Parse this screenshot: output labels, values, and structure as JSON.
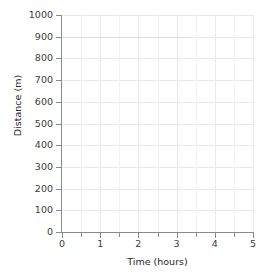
{
  "chart_data": {
    "type": "line",
    "title": "",
    "subtitle": "",
    "xlabel": "Time (hours)",
    "ylabel": "Distance (m)",
    "xlim": [
      0,
      5
    ],
    "ylim": [
      0,
      1000
    ],
    "x_tick_labels": [
      "0",
      "1",
      "2",
      "3",
      "4",
      "5"
    ],
    "x_tick_values": [
      0,
      1,
      2,
      3,
      4,
      5
    ],
    "x_minor_tick_values": [
      0.5,
      1.5,
      2.5,
      3.5,
      4.5
    ],
    "y_tick_labels": [
      "0",
      "100",
      "200",
      "300",
      "400",
      "500",
      "600",
      "700",
      "800",
      "900",
      "1000"
    ],
    "y_tick_values": [
      0,
      100,
      200,
      300,
      400,
      500,
      600,
      700,
      800,
      900,
      1000
    ],
    "grid": true,
    "grid_minor": true,
    "legend": false,
    "legend_position": "none",
    "series": [],
    "values": [],
    "categories": [],
    "annotations": [
      {
        "name": "residual-trace-at-900",
        "y_value": 900,
        "x_start": 0,
        "x_end": 3.35,
        "color": "#dcdce0"
      }
    ]
  },
  "axes": {
    "x": {
      "label": "Time (hours)",
      "ticks": [
        {
          "label": "0",
          "value": 0
        },
        {
          "label": "1",
          "value": 1
        },
        {
          "label": "2",
          "value": 2
        },
        {
          "label": "3",
          "value": 3
        },
        {
          "label": "4",
          "value": 4
        },
        {
          "label": "5",
          "value": 5
        }
      ]
    },
    "y": {
      "label": "Distance (m)",
      "ticks": [
        {
          "label": "1000",
          "value": 1000
        },
        {
          "label": "900",
          "value": 900
        },
        {
          "label": "800",
          "value": 800
        },
        {
          "label": "700",
          "value": 700
        },
        {
          "label": "600",
          "value": 600
        },
        {
          "label": "500",
          "value": 500
        },
        {
          "label": "400",
          "value": 400
        },
        {
          "label": "300",
          "value": 300
        },
        {
          "label": "200",
          "value": 200
        },
        {
          "label": "100",
          "value": 100
        },
        {
          "label": "0",
          "value": 0
        }
      ]
    }
  },
  "colors": {
    "background": "#ffffff",
    "axis": "#8a8a8f",
    "gridline_major": "#e9e9ec",
    "gridline_minor": "#f3f3f5",
    "tick_text": "#3b3b3d",
    "title_text": "#26262a",
    "residual_line": "#dcdce0"
  }
}
